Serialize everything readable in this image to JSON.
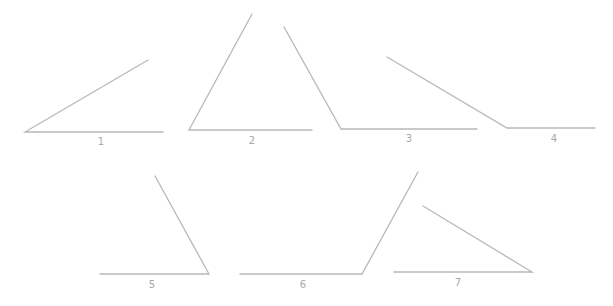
{
  "diagram": {
    "type": "angle-set",
    "line_color": "#b8b8b8",
    "label_color": "#a8a8a8",
    "angles": [
      {
        "label": "1",
        "vertex": [
          25,
          132
        ],
        "ray_end": [
          148,
          60
        ],
        "base_end": [
          163,
          132
        ],
        "label_pos": [
          101,
          145
        ]
      },
      {
        "label": "2",
        "vertex": [
          189,
          130
        ],
        "ray_end": [
          252,
          14
        ],
        "base_end": [
          312,
          130
        ],
        "label_pos": [
          252,
          144
        ]
      },
      {
        "label": "3",
        "vertex": [
          341,
          129
        ],
        "ray_end": [
          284,
          27
        ],
        "base_end": [
          477,
          129
        ],
        "label_pos": [
          409,
          142
        ]
      },
      {
        "label": "4",
        "vertex": [
          507,
          128
        ],
        "ray_end": [
          387,
          57
        ],
        "base_end": [
          595,
          128
        ],
        "label_pos": [
          554,
          142
        ]
      },
      {
        "label": "5",
        "vertex": [
          209,
          274
        ],
        "ray_end": [
          155,
          176
        ],
        "base_end": [
          100,
          274
        ],
        "label_pos": [
          152,
          288
        ]
      },
      {
        "label": "6",
        "vertex": [
          362,
          274
        ],
        "ray_end": [
          418,
          172
        ],
        "base_end": [
          240,
          274
        ],
        "label_pos": [
          303,
          288
        ]
      },
      {
        "label": "7",
        "vertex": [
          532,
          272
        ],
        "ray_end": [
          423,
          206
        ],
        "base_end": [
          394,
          272
        ],
        "label_pos": [
          458,
          286
        ]
      }
    ]
  }
}
